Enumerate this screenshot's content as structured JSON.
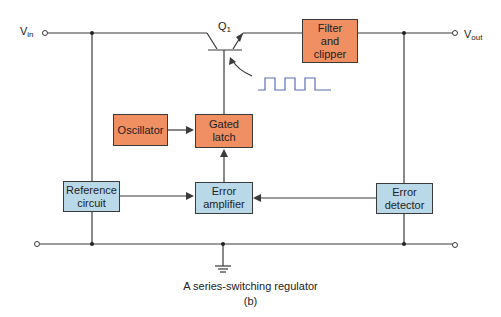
{
  "diagram": {
    "title": "A series-switching regulator",
    "subfigure": "(b)",
    "terminals": {
      "vin": {
        "main": "V",
        "sub": "in"
      },
      "vout": {
        "main": "V",
        "sub": "out"
      },
      "transistor": {
        "main": "Q",
        "sub": "1"
      }
    },
    "blocks": {
      "filter": "Filter\nand\nclipper",
      "oscillator": "Oscillator",
      "gated_latch": "Gated\nlatch",
      "reference": "Reference\ncircuit",
      "error_amplifier": "Error\namplifier",
      "error_detector": "Error\ndetector"
    },
    "colors": {
      "control_block": "#ef8f62",
      "sense_block": "#b9d9e8",
      "wire": "#3a3a3a",
      "pulse_waveform": "#5a6fb8"
    }
  }
}
